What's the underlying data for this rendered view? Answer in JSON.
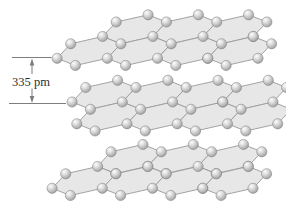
{
  "figure": {
    "label": {
      "text": "335 pm"
    },
    "colors": {
      "background": "#ffffff",
      "ring_fill": "#e7e7e7",
      "bond_stroke": "#9a9a9a",
      "atom_stroke": "#7a7a7a",
      "atom_stops": [
        {
          "offset": 0,
          "color": "#fdfdfd"
        },
        {
          "offset": 0.35,
          "color": "#dcdcdc"
        },
        {
          "offset": 0.72,
          "color": "#b0b0b0"
        },
        {
          "offset": 1,
          "color": "#8c8c8c"
        }
      ],
      "annotation_line": "#7d7d7d",
      "annotation_text": "#2e2e2e"
    },
    "layers": [
      {
        "name": "graphite-layer-top",
        "rows": [
          {
            "role": "back",
            "count": 3,
            "x": 134.5,
            "y": 29.25
          },
          {
            "role": "front",
            "count": 4,
            "x": 89,
            "y": 51
          }
        ]
      },
      {
        "name": "graphite-layer-middle",
        "rows": [
          {
            "role": "back",
            "count": 4,
            "x": 104,
            "y": 94.75
          },
          {
            "role": "front",
            "count": 4,
            "x": 108.7,
            "y": 116.5
          }
        ]
      },
      {
        "name": "graphite-layer-bottom",
        "rows": [
          {
            "role": "back",
            "count": 3,
            "x": 129.4,
            "y": 159
          },
          {
            "role": "front",
            "count": 4,
            "x": 84,
            "y": 181
          }
        ]
      }
    ]
  }
}
